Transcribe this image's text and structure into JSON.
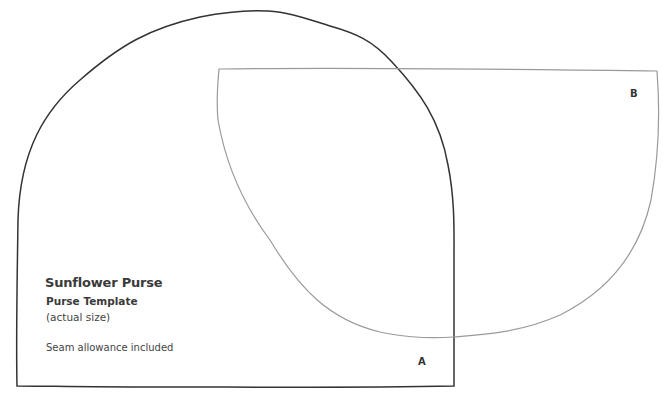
{
  "template": {
    "title": "Sunflower Purse",
    "subtitle": "Purse Template",
    "size_note": "(actual size)",
    "seam_note": "Seam allowance included"
  },
  "pieces": [
    {
      "label": "A",
      "stroke_color": "#333333"
    },
    {
      "label": "B",
      "stroke_color": "#9a9a9a"
    }
  ]
}
